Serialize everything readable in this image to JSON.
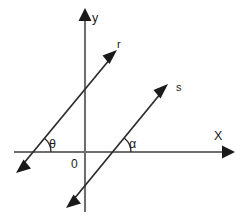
{
  "figure": {
    "background_color": "#ffffff",
    "axis_color": "#6e6e6e",
    "ray_color": "#2b2b2b",
    "label_color": "#1a1a1a",
    "width": 243,
    "height": 221
  },
  "axes": {
    "x": {
      "label": "X",
      "label_x": 214,
      "label_y": 140,
      "y_position": 152,
      "x_start": 14,
      "x_end": 228,
      "has_arrow_right": true,
      "has_arrow_left": false
    },
    "y": {
      "label": "y",
      "label_x": 92,
      "label_y": 22,
      "x_position": 85,
      "y_start": 13,
      "y_end": 212,
      "has_arrow_up": true,
      "has_arrow_down": false
    }
  },
  "origin": {
    "label": "0",
    "label_x": 71,
    "label_y": 168,
    "x": 85,
    "y": 152
  },
  "rays": [
    {
      "name": "r",
      "label": "r",
      "label_x": 117,
      "label_y": 48,
      "x_intercept": 33,
      "tip_x": 115,
      "tip_y": 54,
      "tail_x": 19,
      "tail_y": 169,
      "angle_degrees": 50,
      "has_arrow_head": true,
      "has_arrow_tail": true
    },
    {
      "name": "s",
      "label": "s",
      "label_x": 176,
      "label_y": 91,
      "x_intercept": 113,
      "tip_x": 166,
      "tip_y": 88,
      "tail_x": 70,
      "tail_y": 204,
      "angle_degrees": 50,
      "has_arrow_head": true,
      "has_arrow_tail": true
    }
  ],
  "angles": [
    {
      "name": "theta",
      "label": "θ",
      "label_x": 49,
      "label_y": 148,
      "vertex_x": 33,
      "vertex_y": 152,
      "arc_radius": 16,
      "measure_degrees": 50,
      "belongs_to_ray": "r"
    },
    {
      "name": "alpha",
      "label": "α",
      "label_x": 129,
      "label_y": 148,
      "vertex_x": 113,
      "vertex_y": 152,
      "arc_radius": 16,
      "measure_degrees": 50,
      "belongs_to_ray": "s"
    }
  ]
}
